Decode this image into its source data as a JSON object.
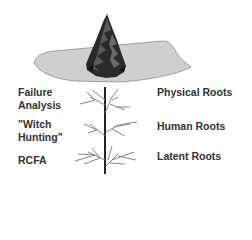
{
  "diagram": {
    "colors": {
      "ground_fill": "#cfcfcf",
      "ground_stroke": "#8a8a8a",
      "tree_dark": "#1e1e1e",
      "tree_mid": "#555555",
      "roots": "#777777",
      "trunk": "#222222",
      "text": "#333333"
    },
    "left_labels": [
      {
        "lines": [
          "Failure",
          "Analysis"
        ]
      },
      {
        "lines": [
          "\"Witch",
          "Hunting\""
        ]
      },
      {
        "lines": [
          "RCFA"
        ]
      }
    ],
    "right_labels": [
      {
        "text": "Physical Roots"
      },
      {
        "text": "Human Roots"
      },
      {
        "text": "Latent Roots"
      }
    ]
  }
}
